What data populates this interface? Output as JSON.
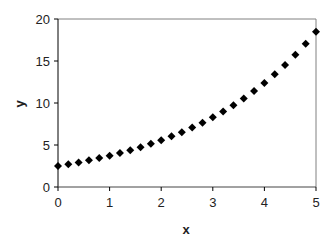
{
  "chart_data": {
    "type": "scatter",
    "title": "",
    "xlabel": "x",
    "ylabel": "y",
    "xlim": [
      0,
      5
    ],
    "ylim": [
      0,
      20
    ],
    "xticks": [
      0,
      1,
      2,
      3,
      4,
      5
    ],
    "yticks": [
      0,
      5,
      10,
      15,
      20
    ],
    "grid": false,
    "legend": null,
    "marker": "diamond",
    "marker_color": "#000000",
    "series": [
      {
        "name": "y",
        "x": [
          0,
          0.2,
          0.4,
          0.6,
          0.8,
          1.0,
          1.2,
          1.4,
          1.6,
          1.8,
          2.0,
          2.2,
          2.4,
          2.6,
          2.8,
          3.0,
          3.2,
          3.4,
          3.6,
          3.8,
          4.0,
          4.2,
          4.4,
          4.6,
          4.8,
          5.0
        ],
        "values": [
          2.5,
          2.71,
          2.93,
          3.18,
          3.44,
          3.73,
          4.04,
          4.38,
          4.74,
          5.14,
          5.56,
          6.03,
          6.53,
          7.07,
          7.66,
          8.3,
          8.99,
          9.74,
          10.55,
          11.43,
          12.38,
          13.41,
          14.53,
          15.74,
          17.05,
          18.47
        ]
      }
    ]
  },
  "colors": {
    "axis": "#000000",
    "frame": "#808080",
    "marker": "#000000"
  }
}
